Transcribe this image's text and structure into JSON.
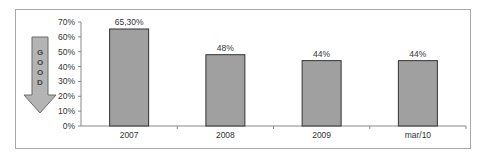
{
  "chart_data": {
    "type": "bar",
    "title": "",
    "xlabel": "",
    "ylabel": "",
    "categories": [
      "2007",
      "2008",
      "2009",
      "mar/10"
    ],
    "values": [
      65.3,
      48,
      44,
      44
    ],
    "data_labels": [
      "65,30%",
      "48%",
      "44%",
      "44%"
    ],
    "ylim": [
      0,
      70
    ],
    "yticks": [
      "0%",
      "10%",
      "20%",
      "30%",
      "40%",
      "50%",
      "60%",
      "70%"
    ],
    "grid": false,
    "legend": null,
    "bar_color": "#a0a0a0",
    "annotation": {
      "type": "down-arrow",
      "text": "GOOD",
      "letters": [
        "G",
        "O",
        "O",
        "D"
      ],
      "meaning": "lower is better"
    }
  }
}
